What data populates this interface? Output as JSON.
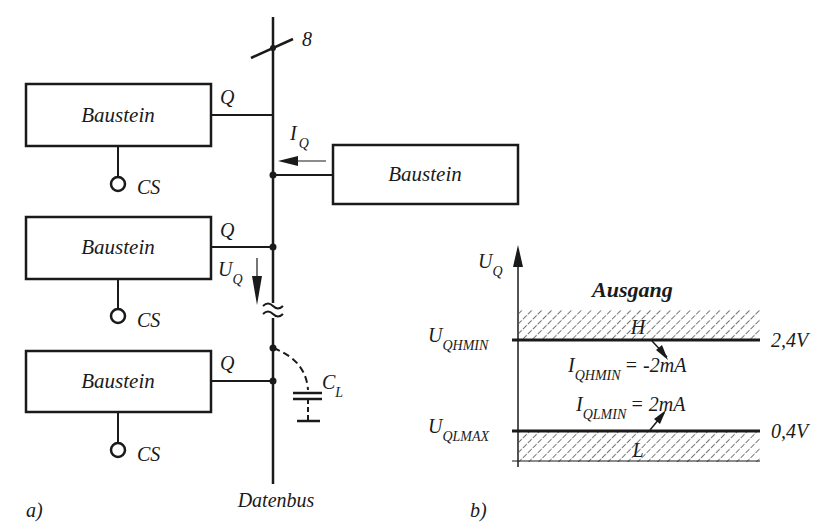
{
  "figure_a": {
    "label": "a)",
    "bus": {
      "label": "Datenbus",
      "width_label": "8"
    },
    "modules": [
      {
        "name": "Baustein",
        "output_label": "Q",
        "select_label": "CS"
      },
      {
        "name": "Baustein",
        "output_label": "Q",
        "select_label": "CS"
      },
      {
        "name": "Baustein",
        "output_label": "Q",
        "select_label": "CS"
      }
    ],
    "load_module": {
      "name": "Baustein"
    },
    "current": {
      "symbol": "I",
      "sub": "Q"
    },
    "voltage": {
      "symbol": "U",
      "sub": "Q"
    },
    "break_symbol": "≈",
    "capacitor": {
      "symbol": "C",
      "sub": "L"
    }
  },
  "figure_b": {
    "label": "b)",
    "axis": {
      "symbol": "U",
      "sub": "Q"
    },
    "title": "Ausgang",
    "high": {
      "level_symbol": "U",
      "level_sub": "QHMIN",
      "value": "2,4V",
      "region_label": "H",
      "current_symbol": "I",
      "current_sub": "QHMIN",
      "current_value": "= -2mA"
    },
    "low": {
      "level_symbol": "U",
      "level_sub": "QLMAX",
      "value": "0,4V",
      "region_label": "L",
      "current_symbol": "I",
      "current_sub": "QLMIN",
      "current_value": "= 2mA"
    }
  },
  "colors": {
    "ink": "#1a1a1a",
    "background": "#ffffff"
  }
}
